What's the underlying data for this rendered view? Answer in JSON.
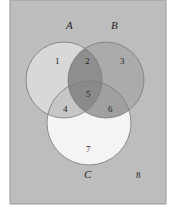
{
  "diagram": {
    "type": "venn",
    "frame": {
      "background": "#bcbcbc",
      "border": "#9a9a9a"
    },
    "sets": [
      {
        "label": "A",
        "color": "#d9d9d9"
      },
      {
        "label": "B",
        "color": "#a6a6a6"
      },
      {
        "label": "C",
        "color": "#f2f2f2"
      }
    ],
    "regions": [
      {
        "id": "1",
        "label": "1",
        "description": "A only"
      },
      {
        "id": "2",
        "label": "2",
        "description": "A and B only"
      },
      {
        "id": "3",
        "label": "3",
        "description": "B only"
      },
      {
        "id": "4",
        "label": "4",
        "description": "A and C only"
      },
      {
        "id": "5",
        "label": "5",
        "description": "A, B and C"
      },
      {
        "id": "6",
        "label": "6",
        "description": "B and C only"
      },
      {
        "id": "7",
        "label": "7",
        "description": "C only"
      },
      {
        "id": "8",
        "label": "8",
        "description": "outside A, B, C"
      }
    ]
  }
}
